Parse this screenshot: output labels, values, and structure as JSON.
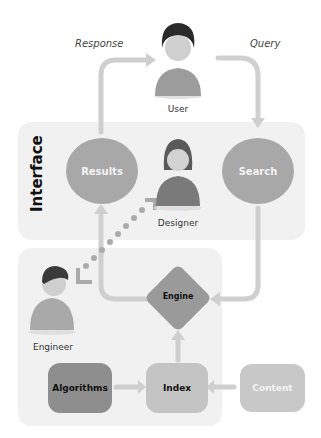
{
  "labels": {
    "response": "Response",
    "query": "Query",
    "user": "User",
    "designer": "Designer",
    "engineer": "Engineer",
    "interface": "Interface"
  },
  "nodes": {
    "results": "Results",
    "search": "Search",
    "engine": "Engine",
    "algorithms": "Algorithms",
    "index": "Index",
    "content": "Content"
  },
  "colors": {
    "panel": "#f1f1f1",
    "circle": "#a8a8a8",
    "engine": "#9a9a9a",
    "algorithms": "#8e8e8e",
    "index": "#c4c4c4",
    "content": "#c8c8c8",
    "arrow": "#cfcfcf"
  }
}
